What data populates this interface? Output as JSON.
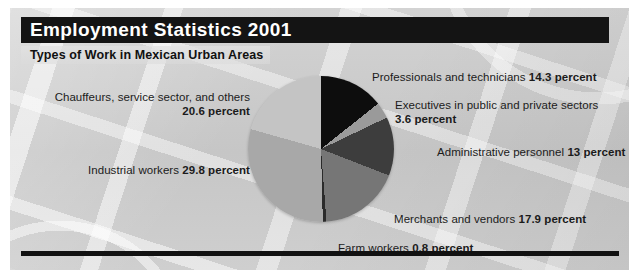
{
  "header": {
    "title": "Employment Statistics 2001",
    "subtitle": "Types of Work in Mexican Urban Areas"
  },
  "colors": {
    "title_bar": "#141414",
    "rule": "#111111",
    "background": "#c9c9c9",
    "text": "#1b1b1b"
  },
  "labels": {
    "chauffeurs_name": "Chauffeurs, service sector, and others",
    "chauffeurs_pct": "20.6 percent",
    "industrial_name": "Industrial workers ",
    "industrial_pct": "29.8 percent",
    "professionals_name": "Professionals and technicians ",
    "professionals_pct": "14.3 percent",
    "executives_name": "Executives in public and private sectors",
    "executives_pct": "3.6 percent",
    "administrative_name": "Administrative personnel ",
    "administrative_pct": "13 percent",
    "merchants_name": "Merchants and vendors ",
    "merchants_pct": "17.9 percent",
    "farm_name": "Farm workers ",
    "farm_pct": "0.8 percent"
  },
  "chart_data": {
    "type": "pie",
    "title": "Employment Statistics 2001",
    "subtitle": "Types of Work in Mexican Urban Areas",
    "unit": "percent",
    "start_angle_deg": 0,
    "direction": "clockwise",
    "categories": [
      "Professionals and technicians",
      "Executives in public and private sectors",
      "Administrative personnel",
      "Merchants and vendors",
      "Farm workers",
      "Industrial workers",
      "Chauffeurs, service sector, and others"
    ],
    "values": [
      14.3,
      3.6,
      13,
      17.9,
      0.8,
      29.8,
      20.6
    ],
    "slice_colors": [
      "#0d0d0d",
      "#9a9a9a",
      "#3d3d3d",
      "#767676",
      "#2a2a2a",
      "#a8a8a8",
      "#c4c4c4"
    ],
    "total": 100.0,
    "legend": "labels-around-pie",
    "grid": false
  }
}
